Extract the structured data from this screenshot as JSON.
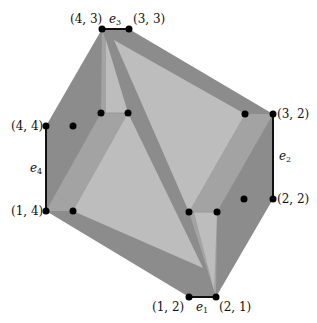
{
  "diagram": {
    "colors": {
      "dark": "#8c8c8c",
      "medium": "#a3a3a3",
      "light": "#bdbdbd",
      "point": "#000000",
      "edge": "#111111"
    },
    "vertices": [
      {
        "id": "v43",
        "label": "(4, 3)",
        "x": 102,
        "y": 29
      },
      {
        "id": "v33",
        "label": "(3, 3)",
        "x": 129,
        "y": 29
      },
      {
        "id": "v32",
        "label": "(3, 2)",
        "x": 273,
        "y": 114
      },
      {
        "id": "v22",
        "label": "(2, 2)",
        "x": 273,
        "y": 199
      },
      {
        "id": "v21",
        "label": "(2, 1)",
        "x": 216,
        "y": 297
      },
      {
        "id": "v12",
        "label": "(1, 2)",
        "x": 189,
        "y": 297
      },
      {
        "id": "v14",
        "label": "(1, 4)",
        "x": 46,
        "y": 211
      },
      {
        "id": "v44",
        "label": "(4, 4)",
        "x": 46,
        "y": 126
      }
    ],
    "inner_points": [
      {
        "x": 101,
        "y": 113
      },
      {
        "x": 128,
        "y": 113
      },
      {
        "x": 245,
        "y": 114
      },
      {
        "x": 244,
        "y": 199
      },
      {
        "x": 189,
        "y": 212
      },
      {
        "x": 217,
        "y": 212
      },
      {
        "x": 73,
        "y": 126
      },
      {
        "x": 73,
        "y": 211
      }
    ],
    "edges": [
      {
        "id": "e1",
        "label": "e",
        "sub": "1",
        "from": "v12",
        "to": "v21"
      },
      {
        "id": "e2",
        "label": "e",
        "sub": "2",
        "from": "v32",
        "to": "v22"
      },
      {
        "id": "e3",
        "label": "e",
        "sub": "3",
        "from": "v43",
        "to": "v33"
      },
      {
        "id": "e4",
        "label": "e",
        "sub": "4",
        "from": "v44",
        "to": "v14"
      }
    ]
  }
}
